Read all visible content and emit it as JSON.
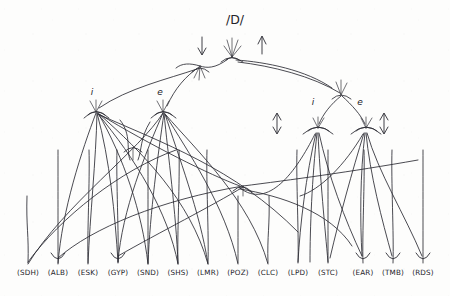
{
  "diagram": {
    "title_text": "/D/",
    "root": {
      "label": "/D/",
      "x": 235,
      "y": 20
    },
    "root_vertex": {
      "x": 232,
      "y": 57
    },
    "root_arrows": [
      {
        "name": "root-down-arrow",
        "direction": "down",
        "x": 202,
        "y_top": 38,
        "y_bottom": 54
      },
      {
        "name": "root-up-arrow",
        "direction": "up",
        "x": 262,
        "y_top": 38,
        "y_bottom": 54
      }
    ],
    "branch_nodes": [
      {
        "id": "left-i",
        "label": "i",
        "label_x": 92,
        "label_y": 92,
        "x": 96,
        "y": 112,
        "side": "left"
      },
      {
        "id": "left-e",
        "label": "e",
        "label_x": 160,
        "label_y": 92,
        "x": 163,
        "y": 112,
        "side": "left"
      },
      {
        "id": "right-i",
        "label": "i",
        "label_x": 313,
        "label_y": 102,
        "x": 318,
        "y": 128,
        "side": "right"
      },
      {
        "id": "right-e",
        "label": "e",
        "label_x": 360,
        "label_y": 102,
        "x": 366,
        "y": 128,
        "side": "right"
      }
    ],
    "right_cluster_vertex": {
      "x": 341,
      "y": 95
    },
    "side_arrows": [
      {
        "name": "right-cluster-left-double-arrow",
        "direction": "double-vertical",
        "x": 277,
        "y_top": 114,
        "y_bottom": 132
      },
      {
        "name": "right-cluster-right-double-arrow",
        "direction": "double-vertical",
        "x": 384,
        "y_top": 114,
        "y_bottom": 132
      }
    ],
    "mid_arrow": {
      "name": "mid-convergence-arrow",
      "x": 243,
      "y": 188
    },
    "leaves": [
      {
        "label": "(SDH)",
        "x": 28,
        "y": 275,
        "stem_top": 196,
        "arrowhead": false
      },
      {
        "label": "(ALB)",
        "x": 58,
        "y": 275,
        "stem_top": 150,
        "arrowhead": true
      },
      {
        "label": "(ESK)",
        "x": 88,
        "y": 275,
        "stem_top": 150,
        "arrowhead": false
      },
      {
        "label": "(GYP)",
        "x": 118,
        "y": 275,
        "stem_top": 150,
        "arrowhead": true
      },
      {
        "label": "(SND)",
        "x": 148,
        "y": 275,
        "stem_top": 150,
        "arrowhead": false
      },
      {
        "label": "(SHS)",
        "x": 178,
        "y": 275,
        "stem_top": 150,
        "arrowhead": false
      },
      {
        "label": "(LMR)",
        "x": 208,
        "y": 275,
        "stem_top": 150,
        "arrowhead": false
      },
      {
        "label": "(POZ)",
        "x": 238,
        "y": 275,
        "stem_top": 196,
        "arrowhead": false
      },
      {
        "label": "(CLC)",
        "x": 268,
        "y": 275,
        "stem_top": 196,
        "arrowhead": false
      },
      {
        "label": "(LPD)",
        "x": 298,
        "y": 275,
        "stem_top": 150,
        "arrowhead": false
      },
      {
        "label": "(STC)",
        "x": 328,
        "y": 275,
        "stem_top": 150,
        "arrowhead": false
      },
      {
        "label": "(EAR)",
        "x": 363,
        "y": 275,
        "stem_top": 150,
        "arrowhead": true
      },
      {
        "label": "(TMB)",
        "x": 393,
        "y": 275,
        "stem_top": 150,
        "arrowhead": true
      },
      {
        "label": "(RDS)",
        "x": 423,
        "y": 275,
        "stem_top": 150,
        "arrowhead": true
      }
    ],
    "colors": {
      "ink": "#2b2b33",
      "paper": "#fdfdfc"
    }
  }
}
